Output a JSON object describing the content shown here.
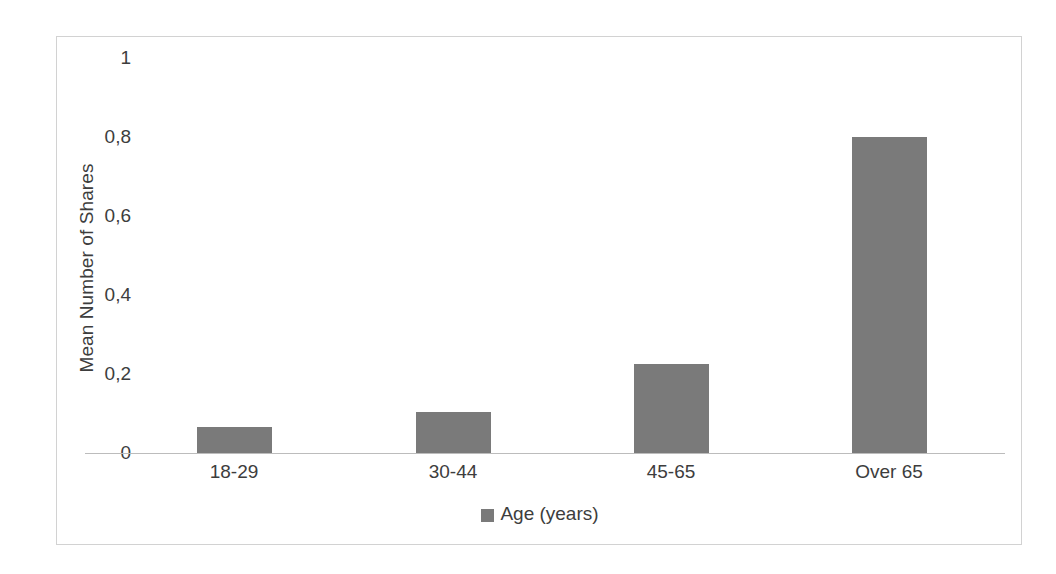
{
  "chart_data": {
    "type": "bar",
    "title": "",
    "subtitle": "",
    "categories": [
      "18-29",
      "30-44",
      "45-65",
      "Over 65"
    ],
    "values": [
      0.065,
      0.105,
      0.225,
      0.8
    ],
    "series": [
      {
        "name": "Age (years)",
        "values": [
          0.065,
          0.105,
          0.225,
          0.8
        ],
        "color": "#7a7a7a"
      }
    ],
    "xlabel": "Age (years)",
    "ylabel": "Mean Number of Shares",
    "ylim": [
      0,
      1
    ],
    "yticks": [
      0,
      0.2,
      0.4,
      0.6,
      0.8,
      1
    ],
    "ytick_labels": [
      "0",
      "0,2",
      "0,4",
      "0,6",
      "0,8",
      "1"
    ],
    "decimal_separator": ",",
    "grid": false,
    "legend_position": "bottom",
    "legend_entries": [
      {
        "label": "Age (years)",
        "color": "#7a7a7a"
      }
    ],
    "bar_color": "#7a7a7a",
    "frame_color": "#d2d2d2",
    "axis_color": "#bcbcbc",
    "background": "#ffffff"
  }
}
